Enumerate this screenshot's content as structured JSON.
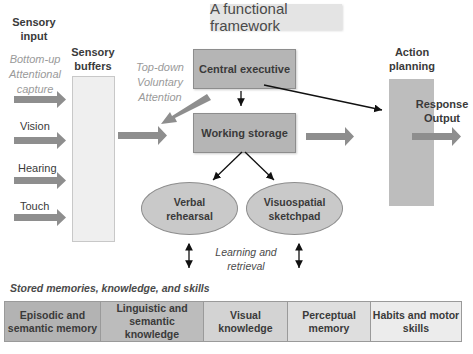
{
  "title": "A functional framework",
  "sensory_input": {
    "heading_line1": "Sensory",
    "heading_line2": "input",
    "bottom_up_line1": "Bottom-up",
    "bottom_up_line2": "Attentional",
    "bottom_up_line3": "capture",
    "inputs": [
      "Vision",
      "Hearing",
      "Touch"
    ]
  },
  "sensory_buffers": {
    "line1": "Sensory",
    "line2": "buffers"
  },
  "top_down": {
    "line1": "Top-down",
    "line2": "Voluntary",
    "line3": "Attention"
  },
  "central_executive": "Central executive",
  "working_storage": "Working storage",
  "verbal_rehearsal": {
    "line1": "Verbal",
    "line2": "rehearsal"
  },
  "visuospatial_sketchpad": {
    "line1": "Visuospatial",
    "line2": "sketchpad"
  },
  "learning_retrieval": {
    "line1": "Learning and",
    "line2": "retrieval"
  },
  "action_planning": {
    "line1": "Action",
    "line2": "planning"
  },
  "response_output": {
    "line1": "Response",
    "line2": "Output"
  },
  "stored_memories": {
    "heading": "Stored memories, knowledge, and skills",
    "cells": [
      {
        "line1": "Episodic and",
        "line2": "semantic memory",
        "line3": "",
        "color": "#b3b3b3"
      },
      {
        "line1": "Linguistic and",
        "line2": "semantic",
        "line3": "knowledge",
        "color": "#bcbcbc"
      },
      {
        "line1": "Visual",
        "line2": "knowledge",
        "line3": "",
        "color": "#d3d3d3"
      },
      {
        "line1": "Perceptual",
        "line2": "memory",
        "line3": "",
        "color": "#dedede"
      },
      {
        "line1": "Habits and motor",
        "line2": "skills",
        "line3": "",
        "color": "#ececec"
      }
    ]
  }
}
